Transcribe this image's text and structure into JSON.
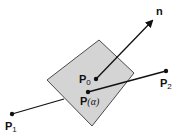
{
  "diagram": {
    "colors": {
      "plane_fill": "#d4d4d4",
      "plane_stroke": "#4a4a4a",
      "line": "#111111",
      "background": "#ffffff"
    },
    "plane": {
      "points": [
        [
          99,
          40
        ],
        [
          134,
          73
        ],
        [
          92,
          126
        ],
        [
          47,
          80
        ]
      ]
    },
    "points": {
      "P1": {
        "x": 12,
        "y": 114,
        "label": "P",
        "sub": "1"
      },
      "P2": {
        "x": 166,
        "y": 71,
        "label": "P",
        "sub": "2"
      },
      "P0": {
        "x": 96,
        "y": 79,
        "label": "P",
        "sub": "0"
      },
      "Palpha": {
        "x": 88,
        "y": 92,
        "label": "P",
        "arg_open": "(",
        "arg": "α",
        "arg_close": ")"
      }
    },
    "normal": {
      "from": [
        96,
        79
      ],
      "to": [
        154,
        19
      ],
      "label": "n"
    }
  }
}
